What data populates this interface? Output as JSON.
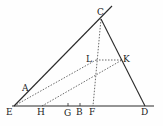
{
  "diagram": {
    "title": "",
    "points": {
      "E": {
        "label": "E",
        "x": 14,
        "y": 106
      },
      "A": {
        "label": "A",
        "x": 26,
        "y": 93
      },
      "C": {
        "label": "C",
        "x": 101,
        "y": 19
      },
      "D": {
        "label": "D",
        "x": 145,
        "y": 106
      },
      "H": {
        "label": "H",
        "x": 42,
        "y": 106
      },
      "G": {
        "label": "G",
        "x": 68,
        "y": 106
      },
      "B": {
        "label": "B",
        "x": 80,
        "y": 106
      },
      "F": {
        "label": "F",
        "x": 93,
        "y": 106
      },
      "L": {
        "label": "L",
        "x": 96,
        "y": 60
      },
      "K": {
        "label": "K",
        "x": 122,
        "y": 60
      }
    },
    "colors": {
      "ink": "#2a2a2a",
      "background": "#fefefe"
    }
  }
}
